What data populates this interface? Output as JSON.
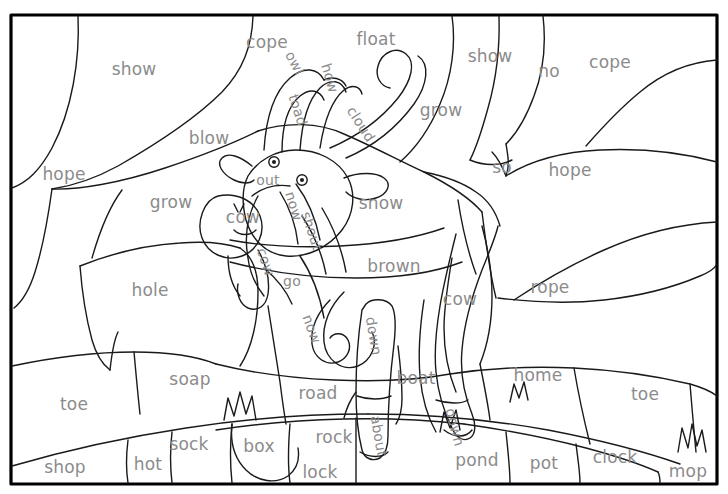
{
  "page": {
    "type": "coloring-worksheet",
    "width": 728,
    "height": 494,
    "text_color": "#8b8b8b",
    "line_color": "#1a1a1a",
    "background_color": "#ffffff"
  },
  "frame": {
    "border_color": "#000000",
    "border_width": 3
  },
  "words": [
    {
      "text": "show",
      "x": 134,
      "y": 69,
      "rot": 0,
      "size": "normal"
    },
    {
      "text": "cope",
      "x": 267,
      "y": 42,
      "rot": 0,
      "size": "normal"
    },
    {
      "text": "float",
      "x": 376,
      "y": 39,
      "rot": 0,
      "size": "normal"
    },
    {
      "text": "show",
      "x": 490,
      "y": 56,
      "rot": 0,
      "size": "normal"
    },
    {
      "text": "no",
      "x": 549,
      "y": 71,
      "rot": 0,
      "size": "normal"
    },
    {
      "text": "cope",
      "x": 610,
      "y": 62,
      "rot": 0,
      "size": "normal"
    },
    {
      "text": "owl",
      "x": 295,
      "y": 63,
      "rot": 62,
      "size": "small"
    },
    {
      "text": "how",
      "x": 330,
      "y": 78,
      "rot": 73,
      "size": "small"
    },
    {
      "text": "toad",
      "x": 298,
      "y": 110,
      "rot": 72,
      "size": "small"
    },
    {
      "text": "cloud",
      "x": 361,
      "y": 124,
      "rot": 57,
      "size": "small"
    },
    {
      "text": "grow",
      "x": 441,
      "y": 110,
      "rot": 0,
      "size": "normal"
    },
    {
      "text": "blow",
      "x": 209,
      "y": 138,
      "rot": 0,
      "size": "normal"
    },
    {
      "text": "hope",
      "x": 64,
      "y": 174,
      "rot": 0,
      "size": "normal"
    },
    {
      "text": "so",
      "x": 502,
      "y": 167,
      "rot": 0,
      "size": "normal"
    },
    {
      "text": "hope",
      "x": 570,
      "y": 170,
      "rot": 0,
      "size": "normal"
    },
    {
      "text": "out",
      "x": 268,
      "y": 180,
      "rot": 0,
      "size": "small"
    },
    {
      "text": "grow",
      "x": 171,
      "y": 202,
      "rot": 0,
      "size": "normal"
    },
    {
      "text": "now",
      "x": 294,
      "y": 206,
      "rot": 73,
      "size": "small"
    },
    {
      "text": "snow",
      "x": 381,
      "y": 203,
      "rot": 0,
      "size": "normal"
    },
    {
      "text": "cow",
      "x": 243,
      "y": 217,
      "rot": 0,
      "size": "normal"
    },
    {
      "text": "shout",
      "x": 312,
      "y": 231,
      "rot": 72,
      "size": "small"
    },
    {
      "text": "brown",
      "x": 394,
      "y": 266,
      "rot": 0,
      "size": "normal"
    },
    {
      "text": "cow",
      "x": 460,
      "y": 299,
      "rot": 0,
      "size": "normal"
    },
    {
      "text": "rope",
      "x": 550,
      "y": 287,
      "rot": 0,
      "size": "normal"
    },
    {
      "text": "hole",
      "x": 150,
      "y": 290,
      "rot": 0,
      "size": "normal"
    },
    {
      "text": "cow",
      "x": 266,
      "y": 262,
      "rot": 72,
      "size": "small"
    },
    {
      "text": "go",
      "x": 292,
      "y": 281,
      "rot": 0,
      "size": "small"
    },
    {
      "text": "now",
      "x": 312,
      "y": 329,
      "rot": 70,
      "size": "small"
    },
    {
      "text": "down",
      "x": 374,
      "y": 336,
      "rot": 80,
      "size": "small"
    },
    {
      "text": "soap",
      "x": 190,
      "y": 379,
      "rot": 0,
      "size": "normal"
    },
    {
      "text": "road",
      "x": 318,
      "y": 393,
      "rot": 0,
      "size": "normal"
    },
    {
      "text": "boat",
      "x": 416,
      "y": 378,
      "rot": 0,
      "size": "normal"
    },
    {
      "text": "home",
      "x": 538,
      "y": 375,
      "rot": 0,
      "size": "normal"
    },
    {
      "text": "toe",
      "x": 74,
      "y": 404,
      "rot": 0,
      "size": "normal"
    },
    {
      "text": "toe",
      "x": 645,
      "y": 394,
      "rot": 0,
      "size": "normal"
    },
    {
      "text": "about",
      "x": 379,
      "y": 436,
      "rot": 80,
      "size": "small"
    },
    {
      "text": "down",
      "x": 455,
      "y": 427,
      "rot": 75,
      "size": "small"
    },
    {
      "text": "sock",
      "x": 189,
      "y": 444,
      "rot": 0,
      "size": "normal"
    },
    {
      "text": "box",
      "x": 259,
      "y": 446,
      "rot": 0,
      "size": "normal"
    },
    {
      "text": "rock",
      "x": 334,
      "y": 437,
      "rot": 0,
      "size": "normal"
    },
    {
      "text": "pond",
      "x": 477,
      "y": 460,
      "rot": 0,
      "size": "normal"
    },
    {
      "text": "pot",
      "x": 544,
      "y": 463,
      "rot": 0,
      "size": "normal"
    },
    {
      "text": "clock",
      "x": 615,
      "y": 457,
      "rot": 0,
      "size": "normal"
    },
    {
      "text": "shop",
      "x": 65,
      "y": 467,
      "rot": 0,
      "size": "normal"
    },
    {
      "text": "hot",
      "x": 148,
      "y": 464,
      "rot": 0,
      "size": "normal"
    },
    {
      "text": "lock",
      "x": 320,
      "y": 472,
      "rot": 0,
      "size": "normal"
    },
    {
      "text": "mop",
      "x": 688,
      "y": 471,
      "rot": 0,
      "size": "normal"
    }
  ]
}
